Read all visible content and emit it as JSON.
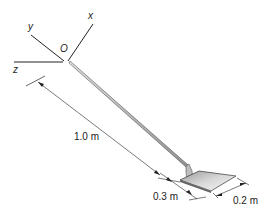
{
  "diagram": {
    "axes": {
      "origin_label": "O",
      "x_label": "x",
      "y_label": "y",
      "z_label": "z"
    },
    "dimensions": {
      "handle_length": "1.0 m",
      "blade_length": "0.3 m",
      "blade_width": "0.2 m"
    },
    "colors": {
      "line": "#222222",
      "handle": "#b8b8b8",
      "blade": "#d4d4d4"
    }
  }
}
